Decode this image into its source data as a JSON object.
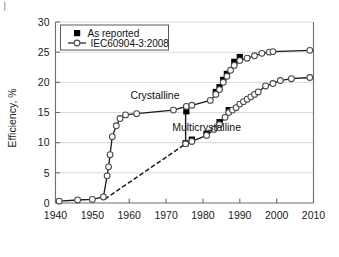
{
  "chart_data": {
    "type": "line",
    "title": "",
    "xlabel": "",
    "ylabel": "Efficiency, %",
    "xlim": [
      1940,
      2010
    ],
    "ylim": [
      0,
      30
    ],
    "xticks": [
      "1940",
      "1950",
      "1960",
      "1970",
      "1980",
      "1990",
      "2000",
      "2010"
    ],
    "yticks": [
      "0",
      "5",
      "10",
      "15",
      "20",
      "25",
      "30"
    ],
    "grid": "horizontal",
    "legend_position": "top-left",
    "legend": [
      {
        "label": "As reported",
        "marker": "filled-square"
      },
      {
        "label": "IEC60904-3:2008",
        "marker": "open-circle-line"
      }
    ],
    "annotations": [
      {
        "text": "Crystalline",
        "x": 1967,
        "y": 17.2
      },
      {
        "text": "Multicrystalline",
        "x": 1981,
        "y": 12.0
      }
    ],
    "series": [
      {
        "name": "Crystalline",
        "style": "solid-open-circle",
        "points": [
          {
            "x": 1941,
            "y": 0.3
          },
          {
            "x": 1946,
            "y": 0.5
          },
          {
            "x": 1950,
            "y": 0.6
          },
          {
            "x": 1953,
            "y": 1.0
          },
          {
            "x": 1954,
            "y": 4.5
          },
          {
            "x": 1954.4,
            "y": 6.0
          },
          {
            "x": 1954.8,
            "y": 8.0
          },
          {
            "x": 1955.4,
            "y": 11.0
          },
          {
            "x": 1956.5,
            "y": 12.8
          },
          {
            "x": 1957.5,
            "y": 14.0
          },
          {
            "x": 1959,
            "y": 14.6
          },
          {
            "x": 1962,
            "y": 14.8
          },
          {
            "x": 1972,
            "y": 15.4
          },
          {
            "x": 1975.5,
            "y": 16.0
          },
          {
            "x": 1977,
            "y": 16.2
          },
          {
            "x": 1982,
            "y": 17.0
          },
          {
            "x": 1983.5,
            "y": 18.0
          },
          {
            "x": 1984.5,
            "y": 18.8
          },
          {
            "x": 1985.5,
            "y": 20.0
          },
          {
            "x": 1986.5,
            "y": 21.0
          },
          {
            "x": 1987.5,
            "y": 22.0
          },
          {
            "x": 1988.5,
            "y": 22.8
          },
          {
            "x": 1990,
            "y": 23.6
          },
          {
            "x": 1992,
            "y": 24.0
          },
          {
            "x": 1994,
            "y": 24.4
          },
          {
            "x": 1996,
            "y": 24.8
          },
          {
            "x": 1998,
            "y": 25.0
          },
          {
            "x": 1999,
            "y": 25.1
          },
          {
            "x": 2009,
            "y": 25.3
          }
        ],
        "as_reported_points": [
          {
            "x": 1975.5,
            "y": 15.2
          },
          {
            "x": 1983.5,
            "y": 18.4
          },
          {
            "x": 1984.5,
            "y": 19.2
          },
          {
            "x": 1985.5,
            "y": 20.4
          },
          {
            "x": 1986.5,
            "y": 21.4
          },
          {
            "x": 1988.5,
            "y": 23.4
          },
          {
            "x": 1990,
            "y": 24.2
          }
        ]
      },
      {
        "name": "Multicrystalline",
        "style": "solid-open-circle",
        "points": [
          {
            "x": 1975.3,
            "y": 9.8
          },
          {
            "x": 1977,
            "y": 10.2
          },
          {
            "x": 1981,
            "y": 11.2
          },
          {
            "x": 1983,
            "y": 12.2
          },
          {
            "x": 1984.5,
            "y": 13.0
          },
          {
            "x": 1986,
            "y": 14.2
          },
          {
            "x": 1987,
            "y": 15.0
          },
          {
            "x": 1988,
            "y": 15.4
          },
          {
            "x": 1989,
            "y": 15.8
          },
          {
            "x": 1990,
            "y": 16.4
          },
          {
            "x": 1991,
            "y": 16.8
          },
          {
            "x": 1992,
            "y": 17.2
          },
          {
            "x": 1993,
            "y": 17.6
          },
          {
            "x": 1994,
            "y": 18.0
          },
          {
            "x": 1995,
            "y": 18.4
          },
          {
            "x": 1997,
            "y": 19.4
          },
          {
            "x": 1999,
            "y": 19.8
          },
          {
            "x": 2001,
            "y": 20.3
          },
          {
            "x": 2004,
            "y": 20.6
          },
          {
            "x": 2009,
            "y": 20.8
          }
        ],
        "as_reported_points": [
          {
            "x": 1975.3,
            "y": 9.9
          },
          {
            "x": 1977,
            "y": 10.5
          },
          {
            "x": 1981,
            "y": 11.5
          },
          {
            "x": 1984.5,
            "y": 13.4
          },
          {
            "x": 1987,
            "y": 15.4
          }
        ],
        "dashed_extrapolation": [
          {
            "x": 1953.5,
            "y": 0.7
          },
          {
            "x": 1975.3,
            "y": 9.8
          }
        ],
        "drop_connector": [
          {
            "x": 1975.3,
            "y": 15.2
          },
          {
            "x": 1975.3,
            "y": 9.9
          }
        ]
      }
    ],
    "colors": {
      "line": "#1a1a1a",
      "marker_fill": "#ffffff",
      "marker_edge": "#4a4a4a",
      "as_reported_fill": "#000000",
      "grid": "#d9d9d9",
      "axis": "#6e6e6e",
      "text": "#1a1a1a",
      "background": "#ffffff"
    }
  }
}
